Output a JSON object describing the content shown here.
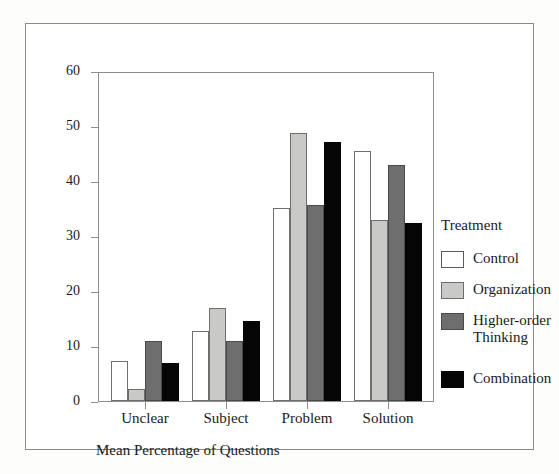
{
  "figure": {
    "caption": "Mean Percentage of Questions"
  },
  "legend": {
    "title": "Treatment",
    "position": "right"
  },
  "chart_data": {
    "type": "bar",
    "title": "",
    "xlabel": "",
    "ylabel": "",
    "caption": "Mean Percentage of Questions",
    "categories": [
      "Unclear",
      "Subject",
      "Problem",
      "Solution"
    ],
    "series": [
      {
        "name": "Control",
        "color": "#ffffff",
        "values": [
          7.2,
          12.8,
          35.1,
          45.4
        ]
      },
      {
        "name": "Organization",
        "color": "#c9c9c7",
        "values": [
          2.2,
          17.0,
          48.8,
          32.9
        ]
      },
      {
        "name": "Higher-order Thinking",
        "color": "#6e6e6e",
        "values": [
          11.0,
          11.0,
          35.7,
          42.9
        ]
      },
      {
        "name": "Combination",
        "color": "#050505",
        "values": [
          6.9,
          14.6,
          47.1,
          32.3
        ]
      }
    ],
    "legend_labels": [
      "Control",
      "Organization",
      "Higher-order Thinking",
      "Combination"
    ],
    "ylim": [
      0,
      60
    ],
    "yticks": [
      0,
      10,
      20,
      30,
      40,
      50,
      60
    ],
    "ytick_labels": [
      "0",
      "10",
      "20",
      "30",
      "40",
      "50",
      "60"
    ],
    "grid": false,
    "legend_position": "right"
  }
}
